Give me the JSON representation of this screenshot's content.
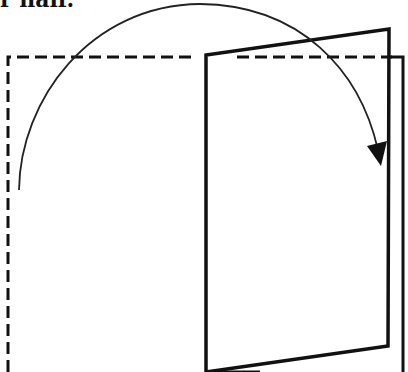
{
  "caption": {
    "text": "r half."
  },
  "diagram": {
    "type": "door-opening-illustration",
    "colors": {
      "stroke": "#111111",
      "background": "#ffffff"
    },
    "dashed_outline": {
      "label": "original-position",
      "style": "dashed"
    },
    "solid_panel": {
      "label": "rotated-panel",
      "style": "solid"
    },
    "arc_arrow": {
      "label": "rotation-direction",
      "icon": "curved-arrow-icon"
    }
  }
}
